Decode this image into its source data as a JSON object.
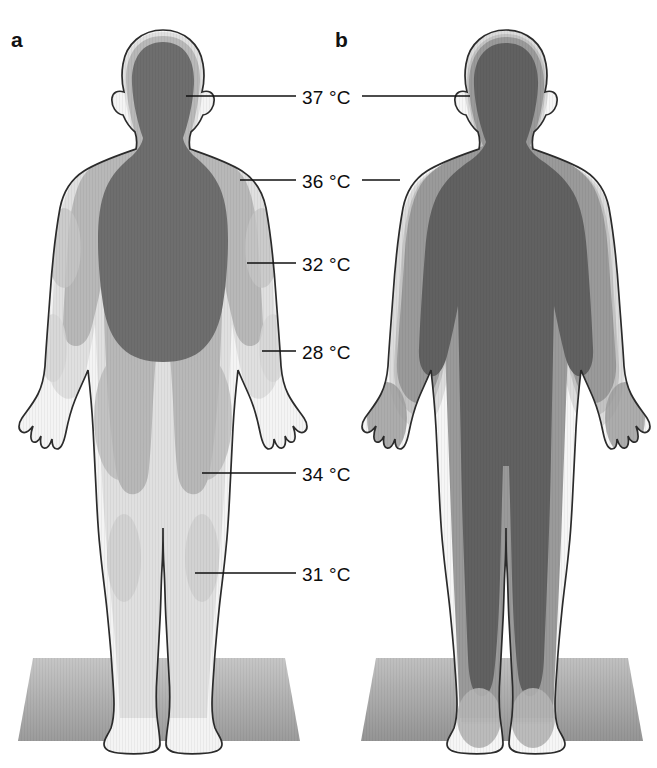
{
  "figure": {
    "panels": [
      {
        "letter": "a",
        "name": "cold-exposure-thermal-profile"
      },
      {
        "letter": "b",
        "name": "heat-exposure-thermal-profile"
      }
    ],
    "labels": [
      {
        "id": "label-37",
        "text": "37 °C",
        "value": 37,
        "unit": "°C",
        "x": 302,
        "y": 88,
        "leader_left": {
          "x1": 186,
          "x2": 296,
          "y": 96
        },
        "leader_right": {
          "x1": 362,
          "x2": 470,
          "y": 96
        }
      },
      {
        "id": "label-36",
        "text": "36 °C",
        "value": 36,
        "unit": "°C",
        "x": 302,
        "y": 172,
        "leader_left": {
          "x1": 240,
          "x2": 296,
          "y": 180
        },
        "leader_right": {
          "x1": 362,
          "x2": 400,
          "y": 180
        }
      },
      {
        "id": "label-32",
        "text": "32 °C",
        "value": 32,
        "unit": "°C",
        "x": 302,
        "y": 255,
        "leader_left": {
          "x1": 247,
          "x2": 296,
          "y": 263
        },
        "leader_right": null
      },
      {
        "id": "label-28",
        "text": "28 °C",
        "value": 28,
        "unit": "°C",
        "x": 302,
        "y": 343,
        "leader_left": {
          "x1": 262,
          "x2": 296,
          "y": 351
        },
        "leader_right": null
      },
      {
        "id": "label-34",
        "text": "34 °C",
        "value": 34,
        "unit": "°C",
        "x": 302,
        "y": 465,
        "leader_left": {
          "x1": 202,
          "x2": 296,
          "y": 473
        },
        "leader_right": null
      },
      {
        "id": "label-31",
        "text": "31 °C",
        "value": 31,
        "unit": "°C",
        "x": 302,
        "y": 565,
        "leader_left": {
          "x1": 195,
          "x2": 296,
          "y": 573
        },
        "leader_right": null
      }
    ]
  },
  "chart_data": {
    "type": "heatmap",
    "subtitle": "Isotherm zones of the human body in cold and warm surroundings",
    "xlabel": "",
    "ylabel": "",
    "legend_position": "inline-callouts",
    "grid": false,
    "categories": [
      "a",
      "b"
    ],
    "series": [
      {
        "name": "a",
        "condition": "cold environment (shell enlarged, core contracted)",
        "isotherms_celsius": [
          37,
          36,
          32,
          28
        ],
        "zones": [
          {
            "label": "core",
            "temperature_c": 37,
            "color": "#6e6e6e",
            "extent": "head, neck, thorax, abdomen"
          },
          {
            "label": "inner shell",
            "temperature_c": 36,
            "color": "#b4b4b4",
            "extent": "shoulders, upper thighs"
          },
          {
            "label": "mid shell",
            "temperature_c": 32,
            "color": "#cfcfcf",
            "extent": "upper arms, forearms, legs"
          },
          {
            "label": "outer shell",
            "temperature_c": 28,
            "color": "#eeeeee",
            "extent": "hands, lower legs, feet"
          }
        ]
      },
      {
        "name": "b",
        "condition": "warm environment (core extends to periphery)",
        "isotherms_celsius": [
          37,
          36,
          34,
          31
        ],
        "zones": [
          {
            "label": "core",
            "temperature_c": 37,
            "color": "#616161",
            "extent": "whole trunk, head, arms, legs"
          },
          {
            "label": "shell",
            "temperature_c": 36,
            "color": "#b0b0b0",
            "extent": "thin rim, hands and feet"
          },
          {
            "label": "distal shell",
            "temperature_c": 34,
            "color": "#c6c6c6",
            "extent": "hands, lower legs"
          },
          {
            "label": "extremity shell",
            "temperature_c": 31,
            "color": "#dcdcdc",
            "extent": "fingers, feet"
          }
        ]
      }
    ]
  },
  "colors": {
    "background": "#ffffff",
    "core_dark": "#6e6e6e",
    "core_dark_b": "#616161",
    "band_mid": "#b4b4b4",
    "band_light": "#cfcfcf",
    "band_lightest": "#e9e9e9",
    "shell_white": "#f7f7f7",
    "outline": "#2b2b2b",
    "floor_top": "#bdbdbd",
    "floor_bottom": "#9a9a9a",
    "leader_line": "#111111",
    "text": "#0d0d0d"
  }
}
